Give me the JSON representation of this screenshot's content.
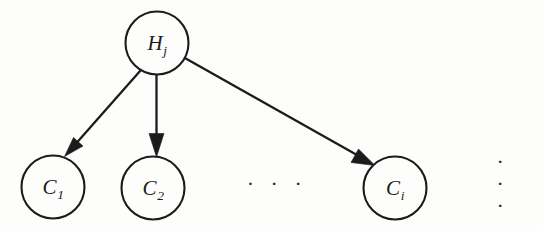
{
  "diagram": {
    "type": "directed-graph",
    "background_color": "#fdfdfc",
    "stroke_color": "#1b1b1b",
    "nodes": [
      {
        "id": "H_j",
        "role": "parent",
        "symbol": "H",
        "subscript": "j",
        "cx": 157,
        "cy": 43,
        "r": 31.5
      },
      {
        "id": "C_1",
        "role": "child",
        "symbol": "C",
        "subscript": "1",
        "cx": 53,
        "cy": 187,
        "r": 31.5
      },
      {
        "id": "C_2",
        "role": "child",
        "symbol": "C",
        "subscript": "2",
        "cx": 153,
        "cy": 188,
        "r": 31.5
      },
      {
        "id": "C_i",
        "role": "child",
        "symbol": "C",
        "subscript": "i",
        "cx": 395,
        "cy": 188,
        "r": 31.5
      }
    ],
    "edges": [
      {
        "id": "edge-hj-c1",
        "from": "H_j",
        "to": "C_1",
        "arrow": true
      },
      {
        "id": "edge-hj-c2",
        "from": "H_j",
        "to": "C_2",
        "arrow": true
      },
      {
        "id": "edge-hj-ci",
        "from": "H_j",
        "to": "C_i",
        "arrow": true
      }
    ],
    "ellipses": [
      {
        "id": "ellipsis-middle",
        "text": "· · ·",
        "x": 277,
        "y": 184
      },
      {
        "id": "ellipsis-right",
        "text": "· · ·",
        "x": 512,
        "y": 184
      }
    ]
  }
}
